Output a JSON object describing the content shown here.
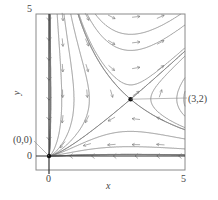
{
  "figure": {
    "type": "phase-portrait",
    "system": {
      "dx_dt": "x*(y - 2)",
      "dy_dt": "y*(x - 3)"
    },
    "axes": {
      "xlabel": "x",
      "ylabel": "y",
      "xlim": [
        0,
        5
      ],
      "ylim": [
        0,
        5
      ],
      "x_ticks": [
        "0",
        "5"
      ],
      "y_ticks": [
        "0",
        "5"
      ]
    },
    "equilibria": [
      {
        "label": "(0,0)",
        "x": 0,
        "y": 0,
        "kind": "sink"
      },
      {
        "label": "(3,2)",
        "x": 3,
        "y": 2,
        "kind": "saddle"
      }
    ],
    "colors": {
      "curve": "#7a7a7a",
      "axis": "#333333",
      "frame": "#8a8a8a",
      "arrow": "#777777",
      "point": "#111111",
      "text": "#444444"
    }
  }
}
